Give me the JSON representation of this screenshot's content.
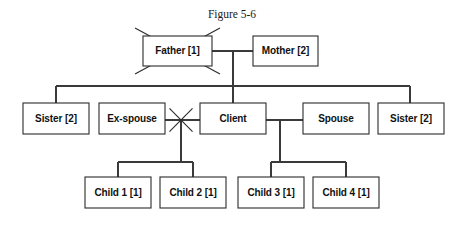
{
  "figure": {
    "title": "Figure 5-6",
    "kind": "genogram",
    "title_center_x": 232,
    "title_y": 14
  },
  "colors": {
    "background": "#ffffff",
    "box_stroke": "#2b2b2b",
    "box_fill": "#ffffff",
    "link_stroke": "#3a3a3a",
    "text": "#111111",
    "title_text": "#1a1a1a"
  },
  "nodes": [
    {
      "id": "father",
      "label": "Father [1]",
      "x": 143,
      "y": 36,
      "w": 69,
      "h": 30,
      "marker": "deceased-x",
      "generation": 1
    },
    {
      "id": "mother",
      "label": "Mother [2]",
      "x": 253,
      "y": 36,
      "w": 65,
      "h": 30,
      "marker": "none",
      "generation": 1
    },
    {
      "id": "sister-l",
      "label": "Sister [2]",
      "x": 23,
      "y": 103,
      "w": 66,
      "h": 31,
      "marker": "none",
      "generation": 2
    },
    {
      "id": "ex-spouse",
      "label": "Ex-spouse",
      "x": 99,
      "y": 103,
      "w": 66,
      "h": 31,
      "marker": "none",
      "generation": 2
    },
    {
      "id": "client",
      "label": "Client",
      "x": 200,
      "y": 103,
      "w": 66,
      "h": 31,
      "marker": "none",
      "generation": 2
    },
    {
      "id": "spouse",
      "label": "Spouse",
      "x": 303,
      "y": 103,
      "w": 66,
      "h": 31,
      "marker": "none",
      "generation": 2
    },
    {
      "id": "sister-r",
      "label": "Sister [2]",
      "x": 378,
      "y": 103,
      "w": 66,
      "h": 31,
      "marker": "none",
      "generation": 2
    },
    {
      "id": "child1",
      "label": "Child 1 [1]",
      "x": 85,
      "y": 177,
      "w": 66,
      "h": 31,
      "marker": "none",
      "generation": 3
    },
    {
      "id": "child2",
      "label": "Child 2 [1]",
      "x": 160,
      "y": 177,
      "w": 66,
      "h": 31,
      "marker": "none",
      "generation": 3
    },
    {
      "id": "child3",
      "label": "Child 3 [1]",
      "x": 238,
      "y": 177,
      "w": 66,
      "h": 31,
      "marker": "none",
      "generation": 3
    },
    {
      "id": "child4",
      "label": "Child 4 [1]",
      "x": 313,
      "y": 177,
      "w": 66,
      "h": 31,
      "marker": "none",
      "generation": 3
    }
  ],
  "markers": {
    "deceased_x": {
      "node": "father",
      "overhang": 8
    },
    "divorce_star": {
      "between": [
        "ex-spouse",
        "client"
      ],
      "cx": 181,
      "cy": 120,
      "radius": 16
    }
  },
  "links": {
    "marriage_parents": {
      "y": 51,
      "x1": 212,
      "x2": 253
    },
    "parents_drop": {
      "x": 233,
      "y1": 51,
      "y2": 86
    },
    "sibling_bar_gen2": {
      "y": 86,
      "x1": 56,
      "x2": 410
    },
    "drops_gen2": [
      {
        "x": 56,
        "y1": 86,
        "y2": 103
      },
      {
        "x": 233,
        "y1": 86,
        "y2": 103
      },
      {
        "x": 410,
        "y1": 86,
        "y2": 103
      }
    ],
    "union_ex_client": {
      "y": 120,
      "x1": 165,
      "x2": 200
    },
    "union_client_spouse": {
      "y": 120,
      "x1": 266,
      "x2": 303
    },
    "drop_ex_union": {
      "x": 181,
      "y1": 120,
      "y2": 162
    },
    "drop_spouse_union": {
      "x": 280,
      "y1": 120,
      "y2": 162
    },
    "sibling_bar_left": {
      "y": 162,
      "x1": 118,
      "x2": 193
    },
    "sibling_bar_right": {
      "y": 162,
      "x1": 271,
      "x2": 346
    },
    "drops_children": [
      {
        "x": 118,
        "y1": 162,
        "y2": 177
      },
      {
        "x": 193,
        "y1": 162,
        "y2": 177
      },
      {
        "x": 271,
        "y1": 162,
        "y2": 177
      },
      {
        "x": 346,
        "y1": 162,
        "y2": 177
      }
    ]
  }
}
